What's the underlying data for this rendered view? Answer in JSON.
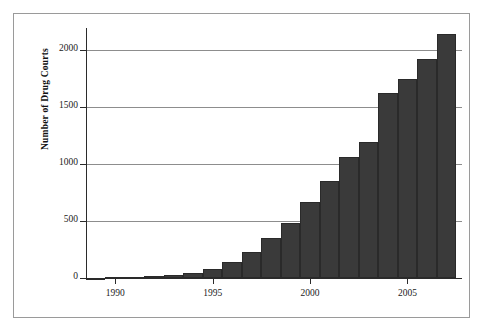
{
  "chart_data": {
    "type": "bar",
    "title": "",
    "subtitle": "",
    "xlabel": "",
    "ylabel": "Number of Drug Courts",
    "categories": [
      1989,
      1990,
      1991,
      1992,
      1993,
      1994,
      1995,
      1996,
      1997,
      1998,
      1999,
      2000,
      2001,
      2002,
      2003,
      2004,
      2005,
      2006,
      2007
    ],
    "values": [
      1,
      5,
      10,
      20,
      30,
      45,
      75,
      140,
      230,
      350,
      480,
      665,
      855,
      1065,
      1190,
      1620,
      1750,
      1920,
      2140
    ],
    "series": [
      {
        "name": "Number of Drug Courts",
        "values": [
          1,
          5,
          10,
          20,
          30,
          45,
          75,
          140,
          230,
          350,
          480,
          665,
          855,
          1065,
          1190,
          1620,
          1750,
          1920,
          2140
        ]
      }
    ],
    "xlim": [
      1988.5,
      2007.8
    ],
    "ylim": [
      0,
      2200
    ],
    "x_ticks": [
      1990,
      2000,
      2005
    ],
    "x_tick_labels": [
      "1990",
      "1995",
      "2000",
      "2005"
    ],
    "x_tick_values": [
      1990,
      1995,
      2000,
      2005
    ],
    "y_ticks": [
      0,
      500,
      1000,
      1500,
      2000
    ],
    "y_tick_labels": [
      "0",
      "500",
      "1000",
      "1500",
      "2000"
    ],
    "grid": "horizontal",
    "legend": "none",
    "bar_color": "#3a3a3a",
    "bar_edge_color": "#2a2a2a",
    "grid_color": "#8d8d8d",
    "axis_color": "#2b2b2b",
    "frame_color": "#9a9a9a",
    "background": "#ffffff"
  }
}
